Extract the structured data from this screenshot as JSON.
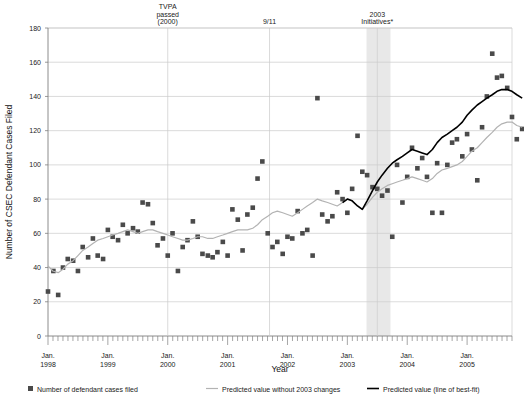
{
  "chart_data": {
    "type": "scatter",
    "title": "",
    "xlabel": "Year",
    "ylabel": "Number of CSEC Defendant Cases Filed",
    "ylim": [
      0,
      180
    ],
    "ytick_step": 20,
    "yticks": [
      "0",
      "20",
      "40",
      "60",
      "80",
      "100",
      "120",
      "140",
      "160",
      "180"
    ],
    "xlim": [
      1998.0,
      2005.75
    ],
    "xticks": [
      {
        "value": 1998,
        "line1": "Jan.",
        "line2": "1998"
      },
      {
        "value": 1999,
        "line1": "Jan.",
        "line2": "1999"
      },
      {
        "value": 2000,
        "line1": "Jan.",
        "line2": "2000"
      },
      {
        "value": 2001,
        "line1": "Jan.",
        "line2": "2001"
      },
      {
        "value": 2002,
        "line1": "Jan.",
        "line2": "2002"
      },
      {
        "value": 2003,
        "line1": "Jan.",
        "line2": "2003"
      },
      {
        "value": 2004,
        "line1": "Jan.",
        "line2": "2004"
      },
      {
        "value": 2005,
        "line1": "Jan.",
        "line2": "2005"
      }
    ],
    "grid": "horizontal",
    "legend_position": "bottom",
    "colors": {
      "marker": "#4a4a4a",
      "predicted_without": "#b3b3b3",
      "best_fit": "#000000",
      "shaded_band": "#e8e8e8",
      "gridline": "#cccccc",
      "axis": "#808080"
    },
    "annotations": [
      {
        "name": "tvpa",
        "x": 2000.0,
        "lines": [
          "TVPA",
          "passed",
          "(2000)"
        ]
      },
      {
        "name": "nine-eleven",
        "x": 2001.7,
        "lines": [
          "9/11"
        ]
      },
      {
        "name": "initiatives-2003",
        "x": 2003.5,
        "lines": [
          "2003",
          "Initiatives*"
        ]
      }
    ],
    "shaded_band": {
      "x_start": 2003.32,
      "x_end": 2003.72
    },
    "legend": [
      {
        "name": "scatter",
        "marker": "square",
        "label": "Number of defendant cases filed",
        "color": "#4a4a4a"
      },
      {
        "name": "predicted-without",
        "marker": "line",
        "label": "Predicted value without 2003 changes",
        "color": "#b3b3b3"
      },
      {
        "name": "best-fit",
        "marker": "line",
        "label": "Predicted value (line of best-fit)",
        "color": "#000000"
      }
    ],
    "series": [
      {
        "name": "Number of defendant cases filed",
        "type": "scatter",
        "points": [
          [
            1998.0,
            26
          ],
          [
            1998.09,
            38
          ],
          [
            1998.17,
            24
          ],
          [
            1998.25,
            40
          ],
          [
            1998.33,
            45
          ],
          [
            1998.42,
            44
          ],
          [
            1998.5,
            38
          ],
          [
            1998.58,
            52
          ],
          [
            1998.67,
            46
          ],
          [
            1998.75,
            57
          ],
          [
            1998.83,
            47
          ],
          [
            1998.92,
            45
          ],
          [
            1999.0,
            62
          ],
          [
            1999.08,
            58
          ],
          [
            1999.17,
            56
          ],
          [
            1999.25,
            65
          ],
          [
            1999.33,
            60
          ],
          [
            1999.42,
            63
          ],
          [
            1999.5,
            61
          ],
          [
            1999.58,
            78
          ],
          [
            1999.67,
            77
          ],
          [
            1999.75,
            66
          ],
          [
            1999.83,
            53
          ],
          [
            1999.92,
            57
          ],
          [
            2000.0,
            47
          ],
          [
            2000.08,
            60
          ],
          [
            2000.17,
            38
          ],
          [
            2000.25,
            52
          ],
          [
            2000.33,
            56
          ],
          [
            2000.42,
            67
          ],
          [
            2000.5,
            58
          ],
          [
            2000.58,
            48
          ],
          [
            2000.67,
            47
          ],
          [
            2000.75,
            46
          ],
          [
            2000.83,
            49
          ],
          [
            2000.92,
            55
          ],
          [
            2001.0,
            47
          ],
          [
            2001.08,
            74
          ],
          [
            2001.17,
            68
          ],
          [
            2001.25,
            50
          ],
          [
            2001.33,
            71
          ],
          [
            2001.42,
            75
          ],
          [
            2001.5,
            92
          ],
          [
            2001.58,
            102
          ],
          [
            2001.67,
            60
          ],
          [
            2001.75,
            52
          ],
          [
            2001.83,
            55
          ],
          [
            2001.92,
            48
          ],
          [
            2002.0,
            58
          ],
          [
            2002.08,
            57
          ],
          [
            2002.17,
            73
          ],
          [
            2002.25,
            60
          ],
          [
            2002.33,
            62
          ],
          [
            2002.42,
            47
          ],
          [
            2002.5,
            139
          ],
          [
            2002.58,
            71
          ],
          [
            2002.67,
            67
          ],
          [
            2002.75,
            70
          ],
          [
            2002.83,
            84
          ],
          [
            2002.92,
            80
          ],
          [
            2003.0,
            72
          ],
          [
            2003.08,
            86
          ],
          [
            2003.17,
            117
          ],
          [
            2003.25,
            96
          ],
          [
            2003.33,
            94
          ],
          [
            2003.42,
            87
          ],
          [
            2003.5,
            86
          ],
          [
            2003.58,
            82
          ],
          [
            2003.67,
            85
          ],
          [
            2003.75,
            58
          ],
          [
            2003.83,
            100
          ],
          [
            2003.92,
            78
          ],
          [
            2004.0,
            93
          ],
          [
            2004.08,
            110
          ],
          [
            2004.17,
            98
          ],
          [
            2004.25,
            104
          ],
          [
            2004.33,
            93
          ],
          [
            2004.42,
            72
          ],
          [
            2004.5,
            101
          ],
          [
            2004.58,
            72
          ],
          [
            2004.67,
            100
          ],
          [
            2004.75,
            113
          ],
          [
            2004.83,
            115
          ],
          [
            2004.92,
            105
          ],
          [
            2005.0,
            118
          ],
          [
            2005.08,
            109
          ],
          [
            2005.17,
            91
          ],
          [
            2005.25,
            122
          ],
          [
            2005.33,
            140
          ],
          [
            2005.42,
            165
          ],
          [
            2005.5,
            151
          ],
          [
            2005.58,
            152
          ],
          [
            2005.67,
            145
          ],
          [
            2005.75,
            128
          ],
          [
            2005.83,
            115
          ],
          [
            2005.92,
            121
          ]
        ]
      },
      {
        "name": "Predicted value without 2003 changes",
        "type": "line",
        "color": "#b3b3b3",
        "points": [
          [
            1998.0,
            41
          ],
          [
            1998.08,
            38
          ],
          [
            1998.17,
            37
          ],
          [
            1998.25,
            39
          ],
          [
            1998.33,
            42
          ],
          [
            1998.42,
            44
          ],
          [
            1998.5,
            47
          ],
          [
            1998.58,
            50
          ],
          [
            1998.67,
            52
          ],
          [
            1998.75,
            54
          ],
          [
            1998.83,
            56
          ],
          [
            1998.92,
            57
          ],
          [
            1999.0,
            58
          ],
          [
            1999.08,
            59
          ],
          [
            1999.17,
            60
          ],
          [
            1999.25,
            61
          ],
          [
            1999.33,
            62
          ],
          [
            1999.42,
            61
          ],
          [
            1999.5,
            60
          ],
          [
            1999.58,
            61
          ],
          [
            1999.67,
            62
          ],
          [
            1999.75,
            62
          ],
          [
            1999.83,
            61
          ],
          [
            1999.92,
            60
          ],
          [
            2000.0,
            59
          ],
          [
            2000.08,
            58
          ],
          [
            2000.17,
            57
          ],
          [
            2000.25,
            56
          ],
          [
            2000.33,
            56
          ],
          [
            2000.42,
            57
          ],
          [
            2000.5,
            58
          ],
          [
            2000.58,
            58
          ],
          [
            2000.67,
            57
          ],
          [
            2000.75,
            57
          ],
          [
            2000.83,
            58
          ],
          [
            2000.92,
            59
          ],
          [
            2001.0,
            60
          ],
          [
            2001.08,
            61
          ],
          [
            2001.17,
            62
          ],
          [
            2001.25,
            62
          ],
          [
            2001.33,
            62
          ],
          [
            2001.42,
            63
          ],
          [
            2001.5,
            65
          ],
          [
            2001.58,
            68
          ],
          [
            2001.67,
            70
          ],
          [
            2001.75,
            72
          ],
          [
            2001.83,
            73
          ],
          [
            2001.92,
            72
          ],
          [
            2002.0,
            71
          ],
          [
            2002.08,
            70
          ],
          [
            2002.17,
            72
          ],
          [
            2002.25,
            74
          ],
          [
            2002.33,
            76
          ],
          [
            2002.42,
            78
          ],
          [
            2002.5,
            80
          ],
          [
            2002.58,
            79
          ],
          [
            2002.67,
            78
          ],
          [
            2002.75,
            77
          ],
          [
            2002.83,
            76
          ],
          [
            2002.92,
            78
          ],
          [
            2003.0,
            80
          ],
          [
            2003.08,
            79
          ],
          [
            2003.17,
            76
          ],
          [
            2003.25,
            74
          ],
          [
            2003.33,
            77
          ],
          [
            2003.42,
            81
          ],
          [
            2003.5,
            84
          ],
          [
            2003.58,
            86
          ],
          [
            2003.67,
            88
          ],
          [
            2003.75,
            89
          ],
          [
            2003.83,
            90
          ],
          [
            2003.92,
            91
          ],
          [
            2004.0,
            92
          ],
          [
            2004.08,
            93
          ],
          [
            2004.17,
            92
          ],
          [
            2004.25,
            91
          ],
          [
            2004.33,
            90
          ],
          [
            2004.42,
            92
          ],
          [
            2004.5,
            95
          ],
          [
            2004.58,
            97
          ],
          [
            2004.67,
            98
          ],
          [
            2004.75,
            99
          ],
          [
            2004.83,
            100
          ],
          [
            2004.92,
            102
          ],
          [
            2005.0,
            105
          ],
          [
            2005.08,
            108
          ],
          [
            2005.17,
            110
          ],
          [
            2005.25,
            113
          ],
          [
            2005.33,
            116
          ],
          [
            2005.42,
            119
          ],
          [
            2005.5,
            122
          ],
          [
            2005.58,
            124
          ],
          [
            2005.67,
            125
          ],
          [
            2005.75,
            125
          ],
          [
            2005.83,
            123
          ],
          [
            2005.92,
            122
          ]
        ]
      },
      {
        "name": "Predicted value (line of best-fit)",
        "type": "line",
        "color": "#000000",
        "points": [
          [
            2002.92,
            78
          ],
          [
            2003.0,
            80
          ],
          [
            2003.08,
            79
          ],
          [
            2003.17,
            76
          ],
          [
            2003.25,
            74
          ],
          [
            2003.33,
            79
          ],
          [
            2003.42,
            85
          ],
          [
            2003.5,
            90
          ],
          [
            2003.58,
            94
          ],
          [
            2003.67,
            98
          ],
          [
            2003.75,
            101
          ],
          [
            2003.83,
            103
          ],
          [
            2003.92,
            105
          ],
          [
            2004.0,
            107
          ],
          [
            2004.08,
            109
          ],
          [
            2004.17,
            108
          ],
          [
            2004.25,
            107
          ],
          [
            2004.33,
            106
          ],
          [
            2004.42,
            109
          ],
          [
            2004.5,
            113
          ],
          [
            2004.58,
            116
          ],
          [
            2004.67,
            118
          ],
          [
            2004.75,
            120
          ],
          [
            2004.83,
            122
          ],
          [
            2004.92,
            125
          ],
          [
            2005.0,
            129
          ],
          [
            2005.08,
            132
          ],
          [
            2005.17,
            135
          ],
          [
            2005.25,
            137
          ],
          [
            2005.33,
            139
          ],
          [
            2005.42,
            141
          ],
          [
            2005.5,
            143
          ],
          [
            2005.58,
            144
          ],
          [
            2005.67,
            144
          ],
          [
            2005.75,
            143
          ],
          [
            2005.83,
            141
          ],
          [
            2005.92,
            139
          ]
        ]
      }
    ]
  }
}
